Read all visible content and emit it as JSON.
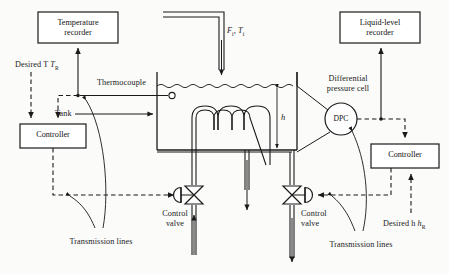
{
  "diagram": {
    "type": "process-instrumentation-diagram",
    "line_color": "#1a1a1a",
    "background": "#fbfbfa"
  },
  "blocks": {
    "temperature_recorder": "Temperature\nrecorder",
    "temperature_recorder_line1": "Temperature",
    "temperature_recorder_line2": "recorder",
    "liquid_level_recorder_line1": "Liquid-level",
    "liquid_level_recorder_line2": "recorder",
    "controller_left": "Controller",
    "controller_right": "Controller",
    "dpc": "DPC"
  },
  "labels": {
    "desired_temperature": "Desired T",
    "desired_temperature_sub": "R",
    "desired_level": "Desired h",
    "desired_level_sub": "R",
    "thermocouple": "Thermocouple",
    "tank": "Tank",
    "differential_pressure_cell_line1": "Differential",
    "differential_pressure_cell_line2": "pressure cell",
    "inlet_flow": "F",
    "inlet_flow_sub": "i",
    "inlet_temp": ", T",
    "inlet_temp_sub": "i",
    "level_variable": "h",
    "control_valve_left_line1": "Control",
    "control_valve_left_line2": "valve",
    "control_valve_right_line1": "Control",
    "control_valve_right_line2": "valve",
    "transmission_lines_left": "Transmission lines",
    "transmission_lines_right": "Transmission lines"
  }
}
